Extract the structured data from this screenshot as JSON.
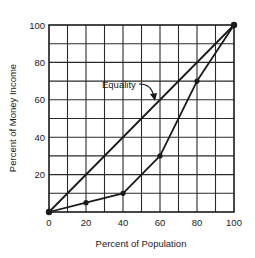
{
  "chart_data": {
    "type": "line",
    "title": "",
    "xlabel": "Percent of Population",
    "ylabel": "Percent of Money Income",
    "xlim": [
      0,
      100
    ],
    "ylim": [
      0,
      100
    ],
    "grid": true,
    "grid_step": 10,
    "x_ticks": [
      "0",
      "20",
      "40",
      "60",
      "80",
      "100"
    ],
    "y_ticks": [
      "20",
      "40",
      "60",
      "80",
      "100"
    ],
    "series": [
      {
        "name": "Equality",
        "x": [
          0,
          100
        ],
        "y": [
          0,
          100
        ],
        "markers": false
      },
      {
        "name": "Lorenz curve",
        "x": [
          0,
          20,
          40,
          60,
          80,
          100
        ],
        "y": [
          0,
          5,
          10,
          30,
          70,
          100
        ],
        "markers": true
      }
    ],
    "annotations": [
      {
        "text": "Equality",
        "points_to": "Equality line",
        "x": 55,
        "y": 60
      }
    ],
    "legend": "none"
  }
}
